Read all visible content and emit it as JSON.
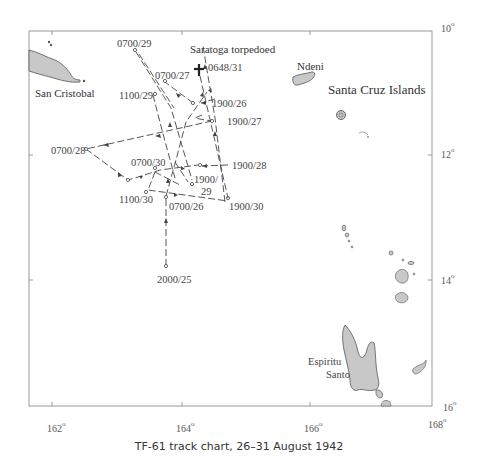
{
  "caption": "TF-61 track chart, 26–31 August 1942",
  "axes": {
    "longitude": [
      {
        "label": "162",
        "deg": "o"
      },
      {
        "label": "164",
        "deg": "o"
      },
      {
        "label": "166",
        "deg": "o"
      },
      {
        "label": "168",
        "deg": "o"
      }
    ],
    "latitude": [
      {
        "label": "10",
        "deg": "o"
      },
      {
        "label": "12",
        "deg": "o"
      },
      {
        "label": "14",
        "deg": "o"
      },
      {
        "label": "16",
        "deg": "o"
      }
    ]
  },
  "places": {
    "san_cristobal": "San Cristobal",
    "ndeni": "Ndeni",
    "santa_cruz": "Santa Cruz Islands",
    "espiritu": "Espiritu",
    "santo": "Santo"
  },
  "event": {
    "title": "Saratoga torpedoed",
    "time": "0648/31"
  },
  "track_points": {
    "p_2000_25": "2000/25",
    "p_0700_26": "0700/26",
    "p_1900_26": "1900/26",
    "p_0700_27": "0700/27",
    "p_1900_27": "1900/27",
    "p_0700_28": "0700/28",
    "p_1900_28": "1900/28",
    "p_0700_29": "0700/29",
    "p_1100_29": "1100/29",
    "p_1900_29a": "1900/",
    "p_1900_29b": "29",
    "p_0700_30": "0700/30",
    "p_1100_30": "1100/30",
    "p_1900_30": "1900/30"
  },
  "colors": {
    "land": "#c8c8c8",
    "coast": "#555555",
    "track": "#444444",
    "frame": "#999999"
  }
}
